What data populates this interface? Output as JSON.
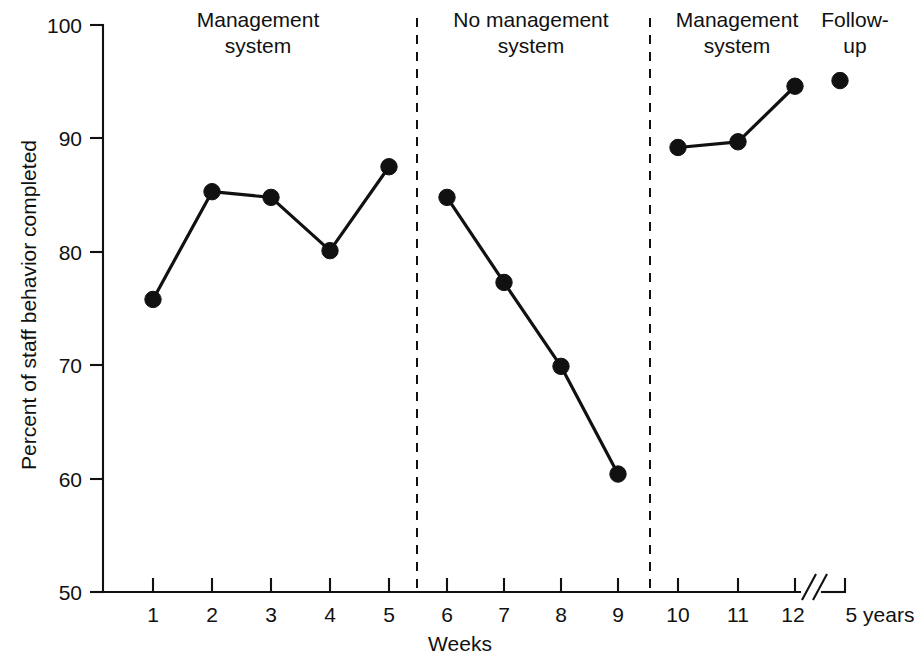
{
  "chart_data": {
    "type": "line",
    "title": "",
    "xlabel": "Weeks",
    "ylabel": "Percent of staff behavior completed",
    "ylim": [
      50,
      100
    ],
    "y_ticks": [
      50,
      60,
      70,
      80,
      90,
      100
    ],
    "x_ticks": [
      "1",
      "2",
      "3",
      "4",
      "5",
      "6",
      "7",
      "8",
      "9",
      "10",
      "11",
      "12",
      "5 years"
    ],
    "grid": false,
    "legend": "none",
    "axis_break": {
      "present": true,
      "symbol": "//",
      "between": [
        "12",
        "5 years"
      ]
    },
    "phases": [
      {
        "label_line1": "Management",
        "label_line2": "system",
        "x_range": [
          "1",
          "5"
        ]
      },
      {
        "label_line1": "No management",
        "label_line2": "system",
        "x_range": [
          "6",
          "9"
        ]
      },
      {
        "label_line1": "Management",
        "label_line2": "system",
        "x_range": [
          "10",
          "12"
        ]
      },
      {
        "label_line1": "Follow-",
        "label_line2": "up",
        "x_range": [
          "5 years",
          "5 years"
        ]
      }
    ],
    "phase_dividers_after": [
      "5",
      "9"
    ],
    "series": [
      {
        "name": "Percent of staff behavior completed",
        "segments": [
          {
            "phase": "Management system",
            "x": [
              "1",
              "2",
              "3",
              "4",
              "5"
            ],
            "values": [
              75.8,
              85.3,
              84.8,
              80.1,
              87.5
            ]
          },
          {
            "phase": "No management system",
            "x": [
              "6",
              "7",
              "8",
              "9"
            ],
            "values": [
              84.8,
              77.3,
              69.9,
              60.4
            ]
          },
          {
            "phase": "Management system",
            "x": [
              "10",
              "11",
              "12"
            ],
            "values": [
              89.2,
              89.7,
              94.6
            ]
          },
          {
            "phase": "Follow-up",
            "x": [
              "5 years"
            ],
            "values": [
              95.1
            ]
          }
        ]
      }
    ]
  },
  "colors": {
    "ink": "#111111",
    "background": "#ffffff"
  }
}
